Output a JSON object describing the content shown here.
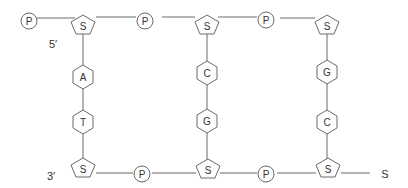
{
  "diagram": {
    "title": "",
    "colors": {
      "stroke": "#6a6a6a",
      "text": "#333333",
      "background": "#ffffff"
    },
    "end_labels": {
      "five_prime": "5′",
      "three_prime": "3′",
      "trailing": "S"
    },
    "top_strand": [
      {
        "type": "phosphate",
        "label": "P"
      },
      {
        "type": "sugar",
        "label": "S"
      },
      {
        "type": "phosphate",
        "label": "P"
      },
      {
        "type": "sugar",
        "label": "S"
      },
      {
        "type": "phosphate",
        "label": "P"
      },
      {
        "type": "sugar",
        "label": "S"
      }
    ],
    "bottom_strand": [
      {
        "type": "sugar",
        "label": "S"
      },
      {
        "type": "phosphate",
        "label": "P"
      },
      {
        "type": "sugar",
        "label": "S"
      },
      {
        "type": "phosphate",
        "label": "P"
      },
      {
        "type": "sugar",
        "label": "S"
      }
    ],
    "base_pairs": [
      {
        "top": "A",
        "bottom": "T"
      },
      {
        "top": "C",
        "bottom": "G"
      },
      {
        "top": "G",
        "bottom": "C"
      }
    ]
  }
}
